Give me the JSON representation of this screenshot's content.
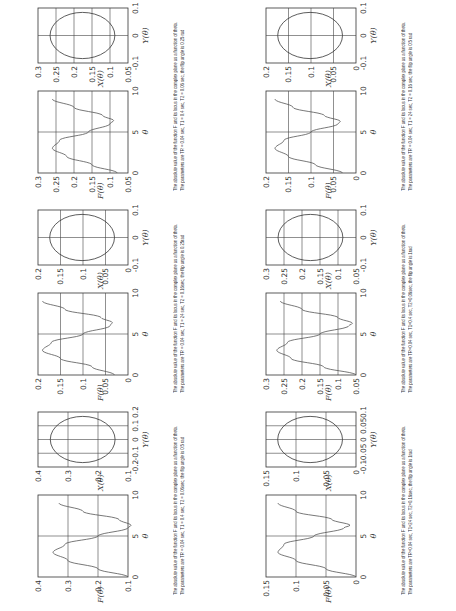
{
  "figure": {
    "theta_label": "θ",
    "f_label": "F(θ)",
    "x_label": "X(θ)",
    "y_label": "Y(θ)",
    "caption_line1": "The absolute value of the function F and its locus in the complex plane as a function of theta.",
    "theta_ticks": [
      "0",
      "5",
      "10"
    ]
  },
  "panels": [
    {
      "id": "p1",
      "caption_line2": "The parameters are TR = 0.04 sec, T1 = 0.4 sec, T2 = 0.06sec, the flip angle is 0.5 rad",
      "f_ticks": [
        "0.1",
        "0.2",
        "0.3",
        "0.4"
      ],
      "x_ticks": [
        "0.1",
        "0.2",
        "0.3",
        "0.4"
      ],
      "y_ticks": [
        "-0.2",
        "-0.1",
        "0",
        "0.1",
        "0.2"
      ]
    },
    {
      "id": "p2",
      "caption_line2": "The parameters are TR = 0.04 sec, T1 = 24 sec, T2 = 0.16sec, the flip angle is 0.25rad",
      "f_ticks": [
        "0",
        "0.05",
        "0.1",
        "0.15",
        "0.2"
      ],
      "x_ticks": [
        "0",
        "0.05",
        "0.1",
        "0.15",
        "0.2"
      ],
      "y_ticks": [
        "-0.1",
        "0",
        "0.1"
      ]
    },
    {
      "id": "p3",
      "caption_line2": "The parameters are TR = 0.04 sec, T1 = 0.4 sec, T2 = 0.06 sec, the flip angle is 0.25 rad",
      "f_ticks": [
        "0.05",
        "0.1",
        "0.15",
        "0.2",
        "0.25",
        "0.3"
      ],
      "x_ticks": [
        "0.05",
        "0.1",
        "0.15",
        "0.2",
        "0.25",
        "0.3"
      ],
      "y_ticks": [
        "-0.1",
        "0",
        "0.1"
      ]
    },
    {
      "id": "p4",
      "caption_line2": "The parameters are TR=0.04 sec, T1=24 sec, T2=0.16sec, the flip angle is 1rad",
      "f_ticks": [
        "0",
        "0.05",
        "0.1",
        "0.15"
      ],
      "x_ticks": [
        "0",
        "0.05",
        "0.1",
        "0.15"
      ],
      "y_ticks": [
        "-0.1",
        "-0.05",
        "0",
        "0.05",
        "0.1"
      ]
    },
    {
      "id": "p5",
      "caption_line2": "The parameters are TR=0.04 sec, T1=0.4 sec, T2=0.06sec, the flip angle is 1rad",
      "f_ticks": [
        "0.05",
        "0.1",
        "0.15",
        "0.2",
        "0.25",
        "0.3"
      ],
      "x_ticks": [
        "0.05",
        "0.1",
        "0.15",
        "0.2",
        "0.25",
        "0.3"
      ],
      "y_ticks": [
        "-0.1",
        "0",
        "0.1"
      ]
    },
    {
      "id": "p6",
      "caption_line2": "The parameters are TR = 0.04 sec, T1 = 24 sec, T2 = 0.16 sec, the flip angle is 0.5 rad",
      "f_ticks": [
        "0",
        "0.05",
        "0.1",
        "0.15",
        "0.2"
      ],
      "x_ticks": [
        "0",
        "0.05",
        "0.1",
        "0.15",
        "0.2"
      ],
      "y_ticks": [
        "-0.1",
        "0",
        "0.1"
      ]
    }
  ],
  "chart_data": [
    {
      "type": "line",
      "title": "|F(θ)|, TR=0.04s T1=0.4s T2=0.06s flip 0.5rad",
      "xlabel": "θ",
      "ylabel": "F(θ)",
      "xlim": [
        0,
        10
      ],
      "ylim": [
        0.1,
        0.4
      ],
      "x": [
        0,
        1,
        2,
        3,
        4,
        5,
        6,
        6.3,
        7,
        8,
        9
      ],
      "values": [
        0.1,
        0.2,
        0.3,
        0.35,
        0.31,
        0.2,
        0.1,
        0.09,
        0.13,
        0.25,
        0.33
      ]
    },
    {
      "type": "line",
      "title": "|F(θ)|, TR=0.04s T1=24s T2=0.16s flip 0.25rad",
      "xlabel": "θ",
      "ylabel": "F(θ)",
      "xlim": [
        0,
        10
      ],
      "ylim": [
        0,
        0.2
      ],
      "x": [
        0,
        1,
        2,
        3,
        4,
        5,
        6,
        6.4,
        7,
        8,
        9
      ],
      "values": [
        0.03,
        0.08,
        0.15,
        0.19,
        0.17,
        0.1,
        0.04,
        0.035,
        0.06,
        0.14,
        0.19
      ]
    },
    {
      "type": "line",
      "title": "|F(θ)|, TR=0.04s T1=0.4s T2=0.06s flip 0.25rad",
      "xlabel": "θ",
      "ylabel": "F(θ)",
      "xlim": [
        0,
        10
      ],
      "ylim": [
        0.05,
        0.3
      ],
      "x": [
        0,
        1,
        2,
        3,
        4,
        5,
        6,
        6.4,
        7,
        8,
        9
      ],
      "values": [
        0.08,
        0.15,
        0.22,
        0.26,
        0.24,
        0.16,
        0.1,
        0.09,
        0.12,
        0.2,
        0.26
      ]
    },
    {
      "type": "line",
      "title": "|F(θ)|, TR=0.04s T1=24s T2=0.16s flip 1rad",
      "xlabel": "θ",
      "ylabel": "F(θ)",
      "xlim": [
        0,
        10
      ],
      "ylim": [
        0,
        0.15
      ],
      "x": [
        0,
        1,
        2,
        3,
        4,
        5,
        6,
        6.3,
        7,
        8,
        9
      ],
      "values": [
        0.0,
        0.05,
        0.1,
        0.13,
        0.12,
        0.07,
        0.02,
        0.01,
        0.04,
        0.1,
        0.13
      ]
    },
    {
      "type": "line",
      "title": "|F(θ)|, TR=0.04s T1=0.4s T2=0.06s flip 1rad",
      "xlabel": "θ",
      "ylabel": "F(θ)",
      "xlim": [
        0,
        10
      ],
      "ylim": [
        0.05,
        0.3
      ],
      "x": [
        0,
        1,
        2,
        3,
        4,
        5,
        6,
        6.3,
        7,
        8,
        9
      ],
      "values": [
        0.05,
        0.14,
        0.23,
        0.27,
        0.24,
        0.15,
        0.07,
        0.06,
        0.1,
        0.2,
        0.26
      ]
    },
    {
      "type": "line",
      "title": "|F(θ)|, TR=0.04s T1=24s T2=0.16s flip 0.5rad",
      "xlabel": "θ",
      "ylabel": "F(θ)",
      "xlim": [
        0,
        10
      ],
      "ylim": [
        0,
        0.2
      ],
      "x": [
        0,
        1,
        2,
        3,
        4,
        5,
        6,
        6.3,
        7,
        8,
        9
      ],
      "values": [
        0.03,
        0.09,
        0.15,
        0.18,
        0.16,
        0.1,
        0.04,
        0.035,
        0.07,
        0.14,
        0.18
      ]
    }
  ]
}
